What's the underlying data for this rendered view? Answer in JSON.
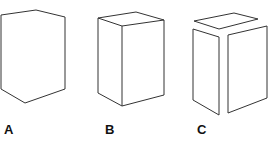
{
  "figures": [
    {
      "id": "A",
      "label": "A",
      "description": "hexagonal outline, no interior edges"
    },
    {
      "id": "B",
      "label": "B",
      "description": "box with visible interior edges"
    },
    {
      "id": "C",
      "label": "C",
      "description": "box faces separated (exploded)"
    }
  ],
  "colors": {
    "stroke": "#333333",
    "background": "#ffffff"
  }
}
